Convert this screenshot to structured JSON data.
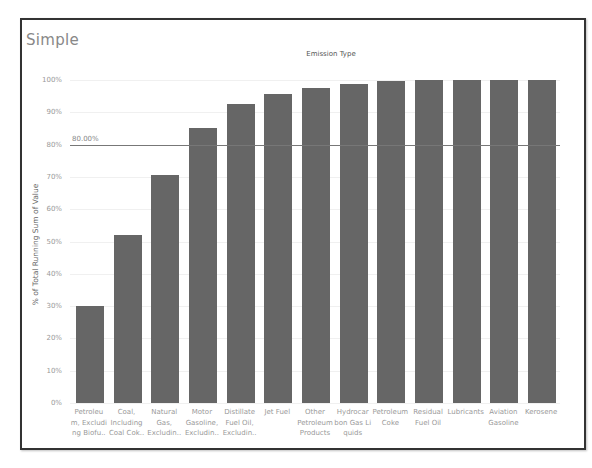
{
  "title": "Simple",
  "column_header": "Emission Type",
  "y_axis_label": "% of Total Running Sum of Value",
  "reference_line": {
    "value": 80,
    "label": "80.00%"
  },
  "y_ticks": [
    "0%",
    "10%",
    "20%",
    "30%",
    "40%",
    "50%",
    "60%",
    "70%",
    "80%",
    "90%",
    "100%"
  ],
  "colors": {
    "bar": "#666666",
    "refline": "#777777",
    "title": "#888888"
  },
  "chart_data": {
    "type": "bar",
    "title": "Simple",
    "subtitle": "Emission Type",
    "xlabel": "Emission Type",
    "ylabel": "% of Total Running Sum of Value",
    "ylim": [
      0,
      100
    ],
    "grid": true,
    "legend": "none",
    "categories": [
      "Petroleum, Excluding Biofuels",
      "Coal, Including Coal Coke",
      "Natural Gas, Excluding",
      "Motor Gasoline, Excluding",
      "Distillate Fuel Oil, Excluding",
      "Jet Fuel",
      "Other Petroleum Products",
      "Hydrocarbon Gas Liquids",
      "Petroleum Coke",
      "Residual Fuel Oil",
      "Lubricants",
      "Aviation Gasoline",
      "Kerosene"
    ],
    "display_labels": [
      [
        "Petroleu",
        "m, Excludi",
        "ng Biofu.."
      ],
      [
        "Coal,",
        "Including",
        "Coal Cok.."
      ],
      [
        "Natural",
        "Gas,",
        "Excludin.."
      ],
      [
        "Motor",
        "Gasoline,",
        "Excludin.."
      ],
      [
        "Distillate",
        "Fuel Oil,",
        "Excludin.."
      ],
      [
        "Jet Fuel"
      ],
      [
        "Other",
        "Petroleum",
        "Products"
      ],
      [
        "Hydrocar",
        "bon Gas Li",
        "quids"
      ],
      [
        "Petroleum",
        "Coke"
      ],
      [
        "Residual",
        "Fuel Oil"
      ],
      [
        "Lubricants"
      ],
      [
        "Aviation",
        "Gasoline"
      ],
      [
        "Kerosene"
      ]
    ],
    "values": [
      30,
      52,
      70.5,
      85,
      92.5,
      95.8,
      97.5,
      98.8,
      99.6,
      99.9,
      100,
      100,
      100
    ],
    "annotations": [
      {
        "type": "reference_line",
        "y": 80,
        "label": "80.00%"
      }
    ]
  }
}
